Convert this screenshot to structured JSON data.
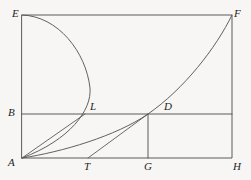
{
  "figure": {
    "background_color": "#f7f6f4",
    "stroke_color": "#4a4a4a",
    "label_color": "#1e1e1e",
    "width": 251,
    "height": 180,
    "points": {
      "E": {
        "label": "E",
        "x": 22,
        "y": 15,
        "label_x": 12,
        "label_y": 8
      },
      "F": {
        "label": "F",
        "x": 232,
        "y": 15,
        "label_x": 234,
        "label_y": 8
      },
      "B": {
        "label": "B",
        "x": 22,
        "y": 114,
        "label_x": 8,
        "label_y": 107
      },
      "L": {
        "label": "L",
        "x": 85,
        "y": 114,
        "label_x": 90,
        "label_y": 101
      },
      "D": {
        "label": "D",
        "x": 148,
        "y": 114,
        "label_x": 164,
        "label_y": 101
      },
      "A": {
        "label": "A",
        "x": 22,
        "y": 158,
        "label_x": 8,
        "label_y": 157
      },
      "T": {
        "label": "T",
        "x": 88,
        "y": 158,
        "label_x": 84,
        "label_y": 161
      },
      "G": {
        "label": "G",
        "x": 148,
        "y": 158,
        "label_x": 144,
        "label_y": 161
      },
      "H": {
        "label": "H",
        "x": 232,
        "y": 158,
        "label_x": 233,
        "label_y": 161
      }
    },
    "segments": [
      {
        "name": "side-EA-left",
        "from": "E",
        "to": "A",
        "kind": "line"
      },
      {
        "name": "side-EF-top",
        "from": "E",
        "to": "F",
        "kind": "line"
      },
      {
        "name": "side-FH-right",
        "from": "F",
        "to": "H",
        "kind": "line"
      },
      {
        "name": "side-AH-bottom",
        "from": "A",
        "to": "H",
        "kind": "line"
      },
      {
        "name": "horizontal-B-to-right-edge",
        "from": "B",
        "to": "H-top",
        "kind": "line"
      },
      {
        "name": "vertical-D-to-G",
        "from": "D",
        "to": "G",
        "kind": "line"
      },
      {
        "name": "chord-A-to-L",
        "from": "A",
        "to": "L",
        "kind": "line"
      },
      {
        "name": "chord-T-to-D",
        "from": "T",
        "to": "D",
        "kind": "line"
      },
      {
        "name": "arc-E-to-L-to-A",
        "from": "E",
        "to": "A",
        "kind": "curve",
        "via": "L"
      },
      {
        "name": "curve-A-to-D-to-F",
        "from": "A",
        "to": "F",
        "kind": "curve",
        "via": "D"
      }
    ],
    "paths": {
      "rect_outer": "M 22 15 L 232 15 L 232 158 L 22 158 Z",
      "line_BH": "M 22 114 L 232 114",
      "line_DG": "M 148 114 L 148 158",
      "chord_AL": "M 22 158 L 85 114",
      "chord_TD": "M 88 158 L 148 114",
      "arc_ELA": "M 22 15 C 58 16 86 52 90 88 C 92 110 70 140 22 158",
      "curve_ADF": "M 22 158 C 62 152 116 136 148 114 C 184 89 216 48 232 15"
    }
  }
}
